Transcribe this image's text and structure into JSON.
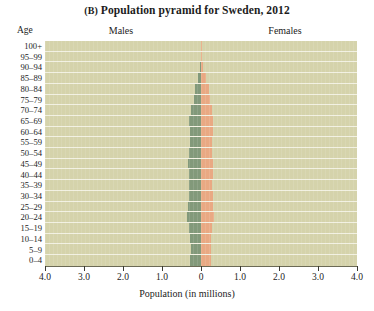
{
  "figure": {
    "panel_letter": "(B)",
    "title": "Population pyramid for Sweden, 2012",
    "age_axis_label": "Age",
    "males_label": "Males",
    "females_label": "Females",
    "xaxis_title": "Population (in millions)",
    "background_color": "#d5d3ab",
    "male_color": "#82997a",
    "female_color": "#e9a983",
    "gridline_color": "#f2f1e2"
  },
  "chart_data": {
    "type": "bar",
    "subtype": "population-pyramid",
    "title": "(B) Population pyramid for Sweden, 2012",
    "xlabel": "Population (in millions)",
    "ylabel": "Age",
    "orientation": "horizontal",
    "grid": true,
    "legend_position": "top",
    "xlim": [
      -4.0,
      4.0
    ],
    "xticks": [
      -4.0,
      -3.0,
      -2.0,
      -1.0,
      0,
      1.0,
      2.0,
      3.0,
      4.0
    ],
    "xticklabels": [
      "4.0",
      "3.0",
      "2.0",
      "1.0",
      "0",
      "1.0",
      "2.0",
      "3.0",
      "4.0"
    ],
    "categories": [
      "100+",
      "95–99",
      "90–94",
      "85–89",
      "80–84",
      "75–79",
      "70–74",
      "65–69",
      "60–64",
      "55–59",
      "50–54",
      "45–49",
      "40–44",
      "35–39",
      "30–34",
      "25–29",
      "20–24",
      "15–19",
      "10–14",
      "5–9",
      "0–4"
    ],
    "series": [
      {
        "name": "Males",
        "side": "left",
        "color": "#82997a",
        "values": [
          0.002,
          0.008,
          0.03,
          0.08,
          0.15,
          0.19,
          0.25,
          0.3,
          0.29,
          0.28,
          0.3,
          0.33,
          0.32,
          0.3,
          0.32,
          0.33,
          0.35,
          0.31,
          0.27,
          0.26,
          0.27
        ]
      },
      {
        "name": "Females",
        "side": "right",
        "color": "#e9a983",
        "values": [
          0.007,
          0.022,
          0.06,
          0.13,
          0.2,
          0.22,
          0.27,
          0.31,
          0.3,
          0.28,
          0.29,
          0.32,
          0.31,
          0.29,
          0.31,
          0.31,
          0.33,
          0.29,
          0.26,
          0.25,
          0.26
        ]
      }
    ]
  }
}
